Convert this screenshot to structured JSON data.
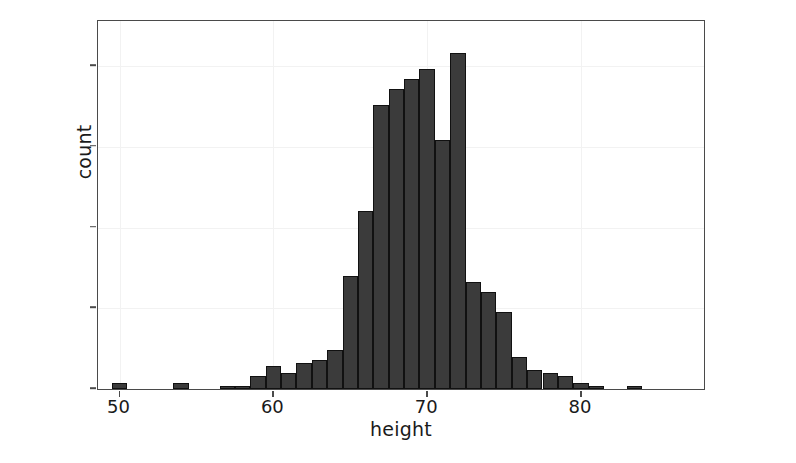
{
  "chart_data": {
    "type": "bar",
    "title": "",
    "subtitle": "",
    "xlabel": "height",
    "ylabel": "count",
    "xlim": [
      48.6,
      88.0
    ],
    "ylim": [
      0,
      114
    ],
    "grid": true,
    "legend": null,
    "bin_width": 1,
    "x_ticks": [
      50,
      60,
      70,
      80
    ],
    "x_tick_labels": [
      "50",
      "60",
      "70",
      "80"
    ],
    "y_ticks": [
      0,
      25,
      50,
      75,
      100
    ],
    "y_tick_labels": [
      "0",
      "25",
      "50",
      "75",
      "100"
    ],
    "bar_color": "#3b3b3b",
    "bar_edge_color": "#111111",
    "panel_border_color": "#4a4a4a",
    "grid_color": "#f2f2f2",
    "bins": [
      {
        "x0": 49.5,
        "x1": 50.5,
        "count": 2
      },
      {
        "x0": 53.5,
        "x1": 54.5,
        "count": 2
      },
      {
        "x0": 56.5,
        "x1": 57.5,
        "count": 1
      },
      {
        "x0": 57.5,
        "x1": 58.5,
        "count": 1
      },
      {
        "x0": 58.5,
        "x1": 59.5,
        "count": 4
      },
      {
        "x0": 59.5,
        "x1": 60.5,
        "count": 7
      },
      {
        "x0": 60.5,
        "x1": 61.5,
        "count": 5
      },
      {
        "x0": 61.5,
        "x1": 62.5,
        "count": 8
      },
      {
        "x0": 62.5,
        "x1": 63.5,
        "count": 9
      },
      {
        "x0": 63.5,
        "x1": 64.5,
        "count": 12
      },
      {
        "x0": 64.5,
        "x1": 65.5,
        "count": 35
      },
      {
        "x0": 65.5,
        "x1": 66.5,
        "count": 55
      },
      {
        "x0": 66.5,
        "x1": 67.5,
        "count": 88
      },
      {
        "x0": 67.5,
        "x1": 68.5,
        "count": 93
      },
      {
        "x0": 68.5,
        "x1": 69.5,
        "count": 96
      },
      {
        "x0": 69.5,
        "x1": 70.5,
        "count": 99
      },
      {
        "x0": 70.5,
        "x1": 71.5,
        "count": 77
      },
      {
        "x0": 71.5,
        "x1": 72.5,
        "count": 104
      },
      {
        "x0": 72.5,
        "x1": 73.5,
        "count": 33
      },
      {
        "x0": 73.5,
        "x1": 74.5,
        "count": 30
      },
      {
        "x0": 74.5,
        "x1": 75.5,
        "count": 24
      },
      {
        "x0": 75.5,
        "x1": 76.5,
        "count": 10
      },
      {
        "x0": 76.5,
        "x1": 77.5,
        "count": 6
      },
      {
        "x0": 77.5,
        "x1": 78.5,
        "count": 5
      },
      {
        "x0": 78.5,
        "x1": 79.5,
        "count": 4
      },
      {
        "x0": 79.5,
        "x1": 80.5,
        "count": 2
      },
      {
        "x0": 80.5,
        "x1": 81.5,
        "count": 1
      },
      {
        "x0": 83.0,
        "x1": 84.0,
        "count": 1
      }
    ]
  }
}
